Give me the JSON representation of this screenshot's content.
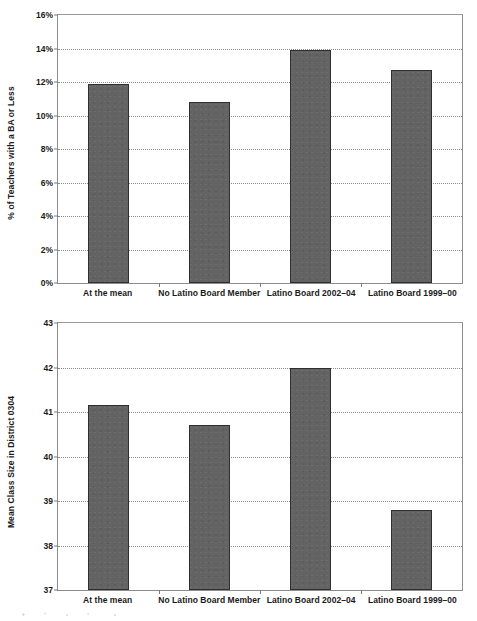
{
  "chart_data": [
    {
      "id": "teachers-ba-or-less",
      "type": "bar",
      "title": "",
      "xlabel": "",
      "ylabel": "% of Teachers with a BA or Less",
      "categories": [
        "At the mean",
        "No Latino Board Member",
        "Latino Board 2002–04",
        "Latino Board 1999–00"
      ],
      "values": [
        11.9,
        10.8,
        13.9,
        12.7
      ],
      "ylim": [
        0,
        16
      ],
      "yticks": [
        0,
        2,
        4,
        6,
        8,
        10,
        12,
        14,
        16
      ],
      "ytick_labels": [
        "0%",
        "2%",
        "4%",
        "6%",
        "8%",
        "10%",
        "12%",
        "14%",
        "16%"
      ],
      "grid": true,
      "legend": "none",
      "bar_color": "#636363",
      "bar_edge_color": "#2f2f2f"
    },
    {
      "id": "mean-class-size-district-0304",
      "type": "bar",
      "title": "",
      "xlabel": "",
      "ylabel": "Mean Class Size in District 0304",
      "categories": [
        "At the mean",
        "No Latino Board Member",
        "Latino Board 2002–04",
        "Latino Board 1999–00"
      ],
      "values": [
        41.15,
        40.7,
        42.0,
        38.8
      ],
      "ylim": [
        37,
        43
      ],
      "yticks": [
        37,
        38,
        39,
        40,
        41,
        42,
        43
      ],
      "ytick_labels": [
        "37",
        "38",
        "39",
        "40",
        "41",
        "42",
        "43"
      ],
      "grid": true,
      "legend": "none",
      "bar_color": "#636363",
      "bar_edge_color": "#2f2f2f"
    }
  ]
}
